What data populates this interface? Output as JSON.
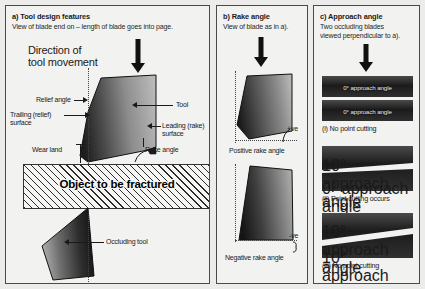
{
  "figure": {
    "background_color": "#ececea",
    "panel_background": "#f2f2f0",
    "border_color": "#4a4a4a"
  },
  "panel_a": {
    "title": "a) Tool design features",
    "subtitle": "View of blade end on – length of blade goes into page.",
    "direction_label_line1": "Direction of",
    "direction_label_line2": "tool movement",
    "labels": {
      "relief_angle": "Relief angle",
      "trailing_surface_line1": "Trailing (relief)",
      "trailing_surface_line2": "surface",
      "wear_land": "Wear land",
      "tool": "Tool",
      "leading_surface_line1": "Leading (rake)",
      "leading_surface_line2": "surface",
      "rake_angle": "Rake angle",
      "occluding_tool": "Occluding tool"
    },
    "object_label": "Object to be fractured"
  },
  "panel_b": {
    "title": "b) Rake angle",
    "subtitle": "View of blade as in a).",
    "positive_marker": "+ve",
    "positive_caption": "Positive rake angle",
    "negative_marker": "-ve",
    "negative_caption": "Negative rake angle"
  },
  "panel_c": {
    "title": "c) Approach angle",
    "subtitle_line1": "Two occluding blades",
    "subtitle_line2": "viewed perpendicular to a).",
    "groups": [
      {
        "top_blade": "0° approach angle",
        "bottom_blade": "0° approach angle",
        "caption": "(i) No point cutting"
      },
      {
        "top_blade": "10° approach angle",
        "bottom_blade": "0° approach angle",
        "caption": "(ii) Point cutting occurs"
      },
      {
        "top_blade": "10° approach angle",
        "bottom_blade": "10° approach angle",
        "caption": "(iii) No point cutting"
      }
    ]
  }
}
